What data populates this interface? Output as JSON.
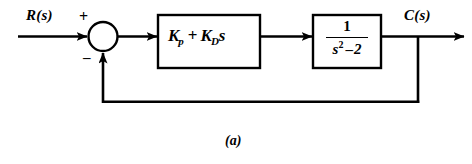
{
  "figure": {
    "caption": "(a)",
    "background_color": "#ffffff",
    "line_color": "#000000"
  },
  "signals": {
    "input_label": "R(s)",
    "output_label": "C(s)"
  },
  "summing_junction": {
    "name": "summing-junction",
    "positive_sign": "+",
    "negative_sign": "–",
    "input_from": "R(s)",
    "feedback_sign": "negative"
  },
  "blocks": [
    {
      "id": "controller",
      "name": "pd-controller-block",
      "gain_proportional": "K",
      "subscript_proportional": "p",
      "operator": "+",
      "gain_derivative": "K",
      "subscript_derivative": "D",
      "derivative_variable": "s",
      "expression": "K_p + K_D s"
    },
    {
      "id": "plant",
      "name": "plant-transfer-function-block",
      "numerator": "1",
      "denominator_base": "s",
      "denominator_exponent": "2",
      "denominator_operator": "–",
      "denominator_constant": "2",
      "expression": "1 / (s^2 - 2)"
    }
  ],
  "feedback": {
    "name": "unity-feedback-path",
    "label": "",
    "type": "unity"
  },
  "icons": {
    "arrow": "arrowhead-icon",
    "takeoff": "takeoff-node-icon"
  }
}
